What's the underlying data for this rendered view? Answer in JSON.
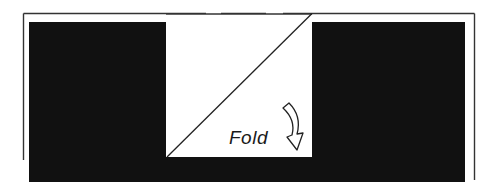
{
  "diagram": {
    "type": "folding-instruction",
    "annotation": {
      "text": "Fold",
      "arrow": "curved-down-arrow"
    },
    "colors": {
      "background": "#ffffff",
      "fill": "#111111",
      "line": "#222222"
    },
    "elements": {
      "outer_frame": "outline rectangle with dashed top segment",
      "left_block": "black rectangle",
      "right_block": "black rectangle",
      "bottom_band": "black band beneath center panel",
      "center_panel": "white square divided by diagonal fold line"
    }
  }
}
